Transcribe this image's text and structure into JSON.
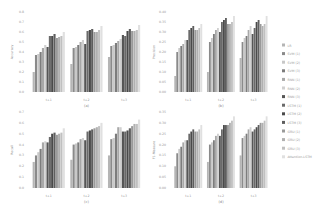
{
  "figure": {
    "legend": [
      {
        "label": "LR",
        "color": "#b5b5b5"
      },
      {
        "label": "SVM (1)",
        "color": "#8a8a8a"
      },
      {
        "label": "SVM (2)",
        "color": "#c8c8c8"
      },
      {
        "label": "SVM (3)",
        "color": "#7c7c7c"
      },
      {
        "label": "RNN (1)",
        "color": "#a8a8a8"
      },
      {
        "label": "RNN (2)",
        "color": "#d0d0d0"
      },
      {
        "label": "RNN (3)",
        "color": "#555555"
      },
      {
        "label": "LSTM (1)",
        "color": "#6a6a6a"
      },
      {
        "label": "LSTM (2)",
        "color": "#4a4a4a"
      },
      {
        "label": "LSTM (3)",
        "color": "#5e5e5e"
      },
      {
        "label": "GRU (1)",
        "color": "#9a9a9a"
      },
      {
        "label": "GRU (2)",
        "color": "#b0b0b0"
      },
      {
        "label": "GRU (3)",
        "color": "#c0c0c0"
      },
      {
        "label": "Attention-LSTM",
        "color": "#e0e0e0"
      }
    ]
  },
  "chart_data": [
    {
      "type": "bar",
      "panel": "(a)",
      "ylabel": "Accuracy",
      "categories": [
        "t+1",
        "t+2",
        "t+3"
      ],
      "ylim": [
        0,
        0.8
      ],
      "yticks": [
        "0.0",
        "0.1",
        "0.2",
        "0.3",
        "0.4",
        "0.5",
        "0.6",
        "0.7",
        "0.8"
      ],
      "series_values": [
        [
          0.2,
          0.28,
          0.35
        ],
        [
          0.37,
          0.44,
          0.46
        ],
        [
          0.38,
          0.45,
          0.47
        ],
        [
          0.4,
          0.47,
          0.49
        ],
        [
          0.44,
          0.5,
          0.51
        ],
        [
          0.47,
          0.52,
          0.53
        ],
        [
          0.45,
          0.48,
          0.57
        ],
        [
          0.56,
          0.61,
          0.56
        ],
        [
          0.56,
          0.62,
          0.61
        ],
        [
          0.58,
          0.63,
          0.63
        ],
        [
          0.54,
          0.6,
          0.61
        ],
        [
          0.55,
          0.6,
          0.61
        ],
        [
          0.56,
          0.62,
          0.62
        ],
        [
          0.6,
          0.66,
          0.67
        ]
      ]
    },
    {
      "type": "bar",
      "panel": "(b)",
      "ylabel": "Precision",
      "categories": [
        "t+1",
        "t+2",
        "t+3"
      ],
      "ylim": [
        0,
        0.4
      ],
      "yticks": [
        "0.00",
        "0.05",
        "0.10",
        "0.15",
        "0.20",
        "0.25",
        "0.30",
        "0.35",
        "0.40"
      ],
      "series_values": [
        [
          0.08,
          0.1,
          0.17
        ],
        [
          0.2,
          0.25,
          0.25
        ],
        [
          0.22,
          0.27,
          0.27
        ],
        [
          0.23,
          0.29,
          0.28
        ],
        [
          0.24,
          0.31,
          0.31
        ],
        [
          0.26,
          0.32,
          0.33
        ],
        [
          0.26,
          0.3,
          0.29
        ],
        [
          0.31,
          0.35,
          0.32
        ],
        [
          0.32,
          0.36,
          0.35
        ],
        [
          0.33,
          0.37,
          0.36
        ],
        [
          0.31,
          0.34,
          0.34
        ],
        [
          0.31,
          0.34,
          0.33
        ],
        [
          0.32,
          0.35,
          0.34
        ],
        [
          0.34,
          0.38,
          0.38
        ]
      ]
    },
    {
      "type": "bar",
      "panel": "(c)",
      "ylabel": "Recall",
      "categories": [
        "t+1",
        "t+2",
        "t+3"
      ],
      "ylim": [
        0,
        0.7
      ],
      "yticks": [
        "0.0",
        "0.1",
        "0.2",
        "0.3",
        "0.4",
        "0.5",
        "0.6",
        "0.7"
      ],
      "series_values": [
        [
          0.24,
          0.26,
          0.3
        ],
        [
          0.3,
          0.4,
          0.45
        ],
        [
          0.33,
          0.41,
          0.46
        ],
        [
          0.36,
          0.42,
          0.5
        ],
        [
          0.42,
          0.45,
          0.56
        ],
        [
          0.43,
          0.46,
          0.56
        ],
        [
          0.42,
          0.44,
          0.52
        ],
        [
          0.47,
          0.52,
          0.52
        ],
        [
          0.5,
          0.53,
          0.53
        ],
        [
          0.51,
          0.54,
          0.55
        ],
        [
          0.49,
          0.55,
          0.57
        ],
        [
          0.5,
          0.56,
          0.59
        ],
        [
          0.51,
          0.57,
          0.59
        ],
        [
          0.55,
          0.6,
          0.63
        ]
      ]
    },
    {
      "type": "bar",
      "panel": "(d)",
      "ylabel": "F1-Measure",
      "categories": [
        "t+1",
        "t+2",
        "t+3"
      ],
      "ylim": [
        0,
        0.35
      ],
      "yticks": [
        "0.00",
        "0.05",
        "0.10",
        "0.15",
        "0.20",
        "0.25",
        "0.30",
        "0.35"
      ],
      "series_values": [
        [
          0.1,
          0.12,
          0.15
        ],
        [
          0.16,
          0.2,
          0.23
        ],
        [
          0.18,
          0.21,
          0.24
        ],
        [
          0.19,
          0.22,
          0.25
        ],
        [
          0.21,
          0.24,
          0.27
        ],
        [
          0.22,
          0.25,
          0.28
        ],
        [
          0.22,
          0.24,
          0.26
        ],
        [
          0.25,
          0.27,
          0.27
        ],
        [
          0.26,
          0.29,
          0.28
        ],
        [
          0.27,
          0.29,
          0.29
        ],
        [
          0.26,
          0.29,
          0.3
        ],
        [
          0.26,
          0.3,
          0.3
        ],
        [
          0.27,
          0.31,
          0.31
        ],
        [
          0.29,
          0.33,
          0.33
        ]
      ]
    }
  ]
}
